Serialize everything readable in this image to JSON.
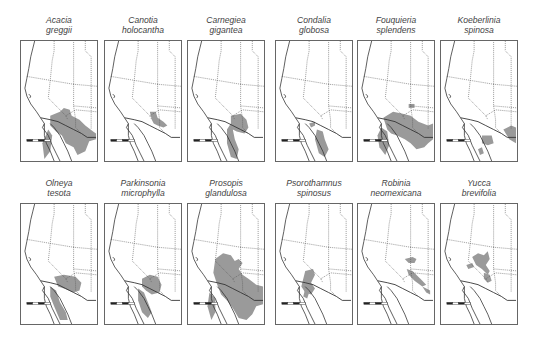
{
  "figure": {
    "type": "species-distribution-maps",
    "region": "Southwestern North America",
    "range_fill": "#9a9a9a",
    "line_color": "#333333",
    "panels": [
      {
        "genus": "Acacia",
        "species": "greggii",
        "row": 0,
        "col": 0,
        "ranges": [
          "M30,76 L40,72 L44,68 L50,70 L52,76 L60,80 L66,86 L74,92 L77,94 L77,100 L70,102 L66,112 L58,116 L54,108 L46,104 L42,96 L36,92 L30,86 Z",
          "M28,90 L32,96 L30,112 L24,120 L22,104 Z"
        ]
      },
      {
        "genus": "Canotia",
        "species": "holocantha",
        "row": 0,
        "col": 1,
        "ranges": [
          "M46,72 L52,72 L54,78 L60,82 L64,86 L60,88 L54,86 L50,84 L48,80 Z"
        ]
      },
      {
        "genus": "Carnegiea",
        "species": "gigantea",
        "row": 0,
        "col": 2,
        "ranges": [
          "M44,76 L54,74 L60,80 L62,88 L58,94 L50,92 L46,90 L48,100 L52,110 L50,120 L44,118 L40,104 L40,90 L44,84 Z"
        ]
      },
      {
        "genus": "Condalia",
        "species": "globosa",
        "row": 0,
        "col": 3,
        "ranges": [
          "M42,90 L48,92 L50,100 L54,110 L50,118 L44,114 L40,100 Z",
          "M34,84 L40,82 L40,86 L36,88 Z"
        ]
      },
      {
        "genus": "Fouquieria",
        "species": "splendens",
        "row": 0,
        "col": 4,
        "ranges": [
          "M26,78 L36,72 L46,74 L54,76 L62,82 L72,86 L77,84 L77,100 L72,104 L68,108 L60,110 L54,104 L48,100 L40,96 L34,94 L30,90 Z",
          "M24,88 L30,92 L32,106 L28,116 L22,108 L20,96 Z",
          "M52,64 L58,64 L58,68 L52,68 Z"
        ]
      },
      {
        "genus": "Koeberlinia",
        "species": "spinosa",
        "row": 0,
        "col": 5,
        "ranges": [
          "M42,96 L52,96 L54,104 L48,106 L42,104 Z",
          "M64,90 L72,86 L77,88 L77,104 L70,100 Z",
          "M38,110 L42,108 L44,114 L40,116 Z"
        ]
      },
      {
        "genus": "Olneya",
        "species": "tesota",
        "row": 1,
        "col": 0,
        "ranges": [
          "M34,74 L44,72 L56,74 L62,80 L60,88 L54,90 L44,86 L38,84 Z",
          "M30,84 L36,88 L40,100 L46,110 L48,118 L40,118 L34,104 L30,94 Z"
        ]
      },
      {
        "genus": "Parkinsonia",
        "species": "microphylla",
        "row": 1,
        "col": 1,
        "ranges": [
          "M38,76 L46,72 L54,74 L58,82 L56,90 L48,92 L42,88 L38,84 Z",
          "M34,86 L40,90 L44,100 L48,110 L44,116 L38,110 L34,98 Z"
        ]
      },
      {
        "genus": "Prosopis",
        "species": "glandulosa",
        "row": 1,
        "col": 2,
        "ranges": [
          "M28,56 L36,50 L44,52 L48,58 L52,56 L56,60 L52,66 L56,72 L62,76 L70,82 L77,84 L77,102 L70,104 L66,112 L60,118 L52,116 L46,106 L40,98 L34,92 L30,82 L26,70 Z",
          "M22,90 L28,96 L28,110 L24,118 L20,104 Z"
        ]
      },
      {
        "genus": "Psorothamnus",
        "species": "spinosus",
        "row": 1,
        "col": 3,
        "ranges": [
          "M30,68 L38,66 L40,72 L36,80 L40,86 L36,92 L30,90 L26,84 L28,76 Z",
          "M30,86 L34,90 L32,96 L28,94 Z"
        ]
      },
      {
        "genus": "Robinia",
        "species": "neomexicana",
        "row": 1,
        "col": 4,
        "ranges": [
          "M48,56 L56,54 L60,56 L58,60 L52,60 Z",
          "M50,66 L56,68 L64,76 L70,82 L66,84 L58,78 L52,72 Z",
          "M66,84 L74,88 L74,92 L70,90 Z"
        ]
      },
      {
        "genus": "Yucca",
        "species": "brevifolia",
        "row": 1,
        "col": 5,
        "ranges": [
          "M32,54 L38,50 L44,52 L48,48 L50,56 L46,62 L50,68 L48,72 L42,66 L36,62 Z",
          "M26,62 L32,60 L34,64 L28,66 Z",
          "M44,70 L50,72 L52,78 L48,80 L44,76 Z"
        ]
      }
    ],
    "basemap": {
      "coast": "M14,0 L12,8 L10,16 L8,28 L6,38 L4,48 L6,56 L10,64 L16,72 L20,78 L24,84 L24,96 L26,104 L30,112 L34,122",
      "baja": "M24,84 L22,88 L28,96 L32,106 L36,114 L40,122",
      "gulf": "M30,84 L34,88 L40,96 L44,104 L48,112 L52,122",
      "border_us_mx": "M20,78 L30,80 L38,82 L46,86 L54,90 L62,94 L68,98 L77,98",
      "state_lines": [
        "M6,36 L30,40 L54,44 L78,46",
        "M34,0 L34,10 L32,20 L30,40",
        "M30,40 L28,58 L46,76 L48,80",
        "M54,44 L54,66 L56,80",
        "M54,44 L54,0",
        "M46,76 L56,70 L78,72",
        "M54,66 L78,68",
        "M66,0 L66,10 L72,16 L72,46",
        "M72,46 L72,68 L72,90",
        "M56,80 L56,88 L62,94"
      ],
      "scalebar": {
        "x": 6,
        "y": 100,
        "w": 24
      }
    }
  }
}
